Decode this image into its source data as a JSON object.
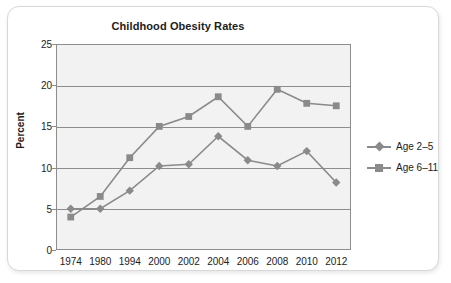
{
  "chart_data": {
    "type": "line",
    "title": "Childhood Obesity Rates",
    "xlabel": "",
    "ylabel": "Percent",
    "categories": [
      "1974",
      "1980",
      "1994",
      "2000",
      "2002",
      "2004",
      "2006",
      "2008",
      "2010",
      "2012"
    ],
    "ylim": [
      0,
      25
    ],
    "yticks": [
      0,
      5,
      10,
      15,
      20,
      25
    ],
    "grid": true,
    "legend_position": "right",
    "series": [
      {
        "name": "Age 2–5",
        "marker": "diamond",
        "color": "#8a8a8a",
        "values": [
          5.0,
          5.0,
          7.2,
          10.2,
          10.4,
          13.8,
          10.9,
          10.2,
          12.0,
          8.2
        ]
      },
      {
        "name": "Age 6–11",
        "marker": "square",
        "color": "#8a8a8a",
        "values": [
          4.0,
          6.5,
          11.2,
          15.0,
          16.2,
          18.6,
          15.0,
          19.5,
          17.8,
          17.5
        ]
      }
    ]
  },
  "style": {
    "plot_background": "#f2f2f2",
    "axis_color": "#8d8d8d",
    "text_color": "#1c1c1c",
    "card_border": "#d8d8d8"
  }
}
